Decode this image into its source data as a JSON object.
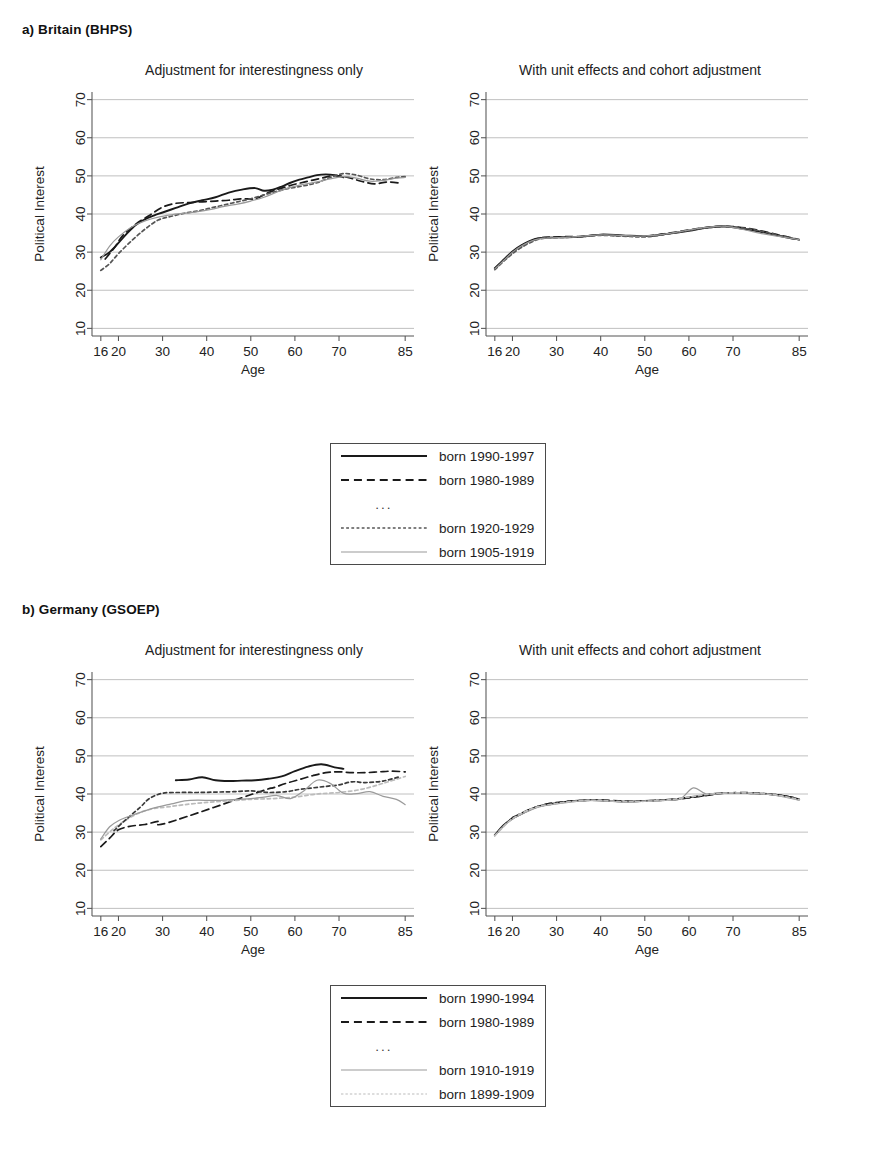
{
  "figure": {
    "sections": [
      {
        "id": "britain",
        "heading": "a) Britain (BHPS)"
      },
      {
        "id": "germany",
        "heading": "b) Germany (GSOEP)"
      }
    ],
    "panel_titles": {
      "left": "Adjustment for interestingness only",
      "right": "With unit effects and cohort adjustment"
    },
    "axis": {
      "xlabel": "Age",
      "ylabel": "Political Interest",
      "xticks": [
        16,
        20,
        30,
        40,
        50,
        60,
        70,
        85
      ],
      "xticklabels": [
        "16",
        "20",
        "30",
        "40",
        "50",
        "60",
        "70",
        "85"
      ],
      "yticks": [
        10,
        20,
        30,
        40,
        50,
        60,
        70
      ],
      "yticklabels": [
        "10",
        "20",
        "30",
        "40",
        "50",
        "60",
        "70"
      ],
      "xlim": [
        14,
        87
      ],
      "ylim": [
        8,
        72
      ]
    },
    "legends": {
      "britain": {
        "entries": [
          {
            "label": "born 1990-1997",
            "style": "solid",
            "color": "#1a1a1a",
            "width": 1.9
          },
          {
            "label": "born 1980-1989",
            "style": "dashed",
            "color": "#1a1a1a",
            "width": 1.9
          },
          {
            "label": "...",
            "style": "ellipsis",
            "color": "#3a3a3a",
            "width": 1
          },
          {
            "label": "born 1920-1929",
            "style": "dotted",
            "color": "#555555",
            "width": 1.4
          },
          {
            "label": "born 1905-1919",
            "style": "solid",
            "color": "#9a9a9a",
            "width": 1.2
          }
        ]
      },
      "germany": {
        "entries": [
          {
            "label": "born 1990-1994",
            "style": "solid",
            "color": "#1a1a1a",
            "width": 1.9
          },
          {
            "label": "born 1980-1989",
            "style": "dashed",
            "color": "#1a1a1a",
            "width": 1.9
          },
          {
            "label": "...",
            "style": "ellipsis",
            "color": "#3a3a3a",
            "width": 1
          },
          {
            "label": "born 1910-1919",
            "style": "solid",
            "color": "#9a9a9a",
            "width": 1.2
          },
          {
            "label": "born 1899-1909",
            "style": "dotted",
            "color": "#bbbbbb",
            "width": 1.2
          }
        ]
      }
    }
  },
  "chart_data": [
    {
      "id": "britain-left",
      "type": "line",
      "title": "Adjustment for interestingness only",
      "section": "a) Britain (BHPS)",
      "xlabel": "Age",
      "ylabel": "Political Interest",
      "xlim": [
        14,
        87
      ],
      "ylim": [
        8,
        72
      ],
      "grid": true,
      "legend_position": "below-figure",
      "series": [
        {
          "name": "born 1990-1997",
          "style": "solid",
          "color": "#1a1a1a",
          "x": [
            16,
            18,
            20,
            22,
            24,
            26,
            28,
            30,
            33,
            36,
            39,
            42,
            45,
            48,
            51,
            53,
            55,
            57,
            59,
            61,
            63,
            65,
            67,
            69,
            71
          ],
          "y": [
            28.6,
            30.0,
            32.4,
            35.0,
            37.2,
            38.6,
            39.6,
            40.4,
            41.6,
            42.8,
            43.6,
            44.4,
            45.6,
            46.4,
            46.8,
            46.1,
            46.4,
            47.2,
            48.2,
            49.0,
            49.6,
            50.2,
            50.4,
            50.2,
            49.6
          ]
        },
        {
          "name": "born 1980-1989",
          "style": "dashed",
          "color": "#1a1a1a",
          "x": [
            17,
            19,
            21,
            24,
            27,
            30,
            33,
            36,
            39,
            42,
            45,
            48,
            51,
            54,
            57,
            60,
            63,
            66,
            69,
            72,
            75,
            78,
            81,
            84
          ],
          "y": [
            28.2,
            31.0,
            34.4,
            37.4,
            39.6,
            41.8,
            42.8,
            43.0,
            43.2,
            43.4,
            43.6,
            44.0,
            44.0,
            45.6,
            46.8,
            47.8,
            48.6,
            49.4,
            50.1,
            49.6,
            48.6,
            47.9,
            48.4,
            48.1
          ]
        },
        {
          "name": "born 1920-1929",
          "style": "dotted",
          "color": "#555555",
          "x": [
            16,
            18,
            20,
            23,
            26,
            29,
            32,
            35,
            38,
            41,
            44,
            47,
            50,
            53,
            56,
            59,
            62,
            65,
            68,
            71,
            74,
            77,
            80,
            83,
            85
          ],
          "y": [
            25.2,
            27.0,
            29.6,
            33.0,
            36.0,
            38.4,
            39.4,
            40.2,
            40.8,
            41.6,
            42.4,
            43.2,
            44.0,
            45.0,
            46.0,
            46.8,
            47.4,
            48.2,
            49.6,
            50.6,
            50.2,
            49.2,
            49.0,
            49.6,
            49.8
          ]
        },
        {
          "name": "born 1905-1919",
          "style": "solid",
          "color": "#9a9a9a",
          "x": [
            16,
            18,
            20,
            23,
            26,
            29,
            32,
            35,
            38,
            41,
            44,
            47,
            50,
            53,
            56,
            59,
            62,
            65,
            68,
            71,
            74,
            77,
            80,
            83,
            85
          ],
          "y": [
            28.0,
            31.6,
            34.0,
            36.6,
            38.2,
            39.2,
            39.8,
            40.2,
            40.6,
            41.2,
            42.0,
            42.6,
            43.4,
            44.4,
            45.8,
            47.0,
            47.8,
            48.4,
            49.2,
            49.8,
            49.4,
            48.6,
            48.8,
            49.4,
            49.6
          ]
        }
      ]
    },
    {
      "id": "britain-right",
      "type": "line",
      "title": "With unit effects and cohort adjustment",
      "section": "a) Britain (BHPS)",
      "xlabel": "Age",
      "ylabel": "Political Interest",
      "xlim": [
        14,
        87
      ],
      "ylim": [
        8,
        72
      ],
      "grid": true,
      "legend_position": "below-figure",
      "series": [
        {
          "name": "born 1990-1997",
          "style": "solid",
          "color": "#1a1a1a",
          "x": [
            16,
            18,
            20,
            22,
            25,
            28,
            31,
            35,
            40,
            45,
            50,
            55,
            60,
            64,
            68,
            72,
            76,
            80,
            84
          ],
          "y": [
            25.8,
            28.0,
            30.2,
            31.8,
            33.4,
            33.8,
            33.9,
            34.0,
            34.6,
            34.4,
            34.2,
            34.8,
            35.6,
            36.4,
            36.8,
            36.2,
            35.4,
            34.4,
            33.4
          ]
        },
        {
          "name": "born 1980-1989",
          "style": "dashed",
          "color": "#1a1a1a",
          "x": [
            16,
            19,
            22,
            26,
            30,
            35,
            40,
            45,
            50,
            55,
            60,
            65,
            70,
            75,
            80,
            85
          ],
          "y": [
            25.6,
            29.0,
            31.6,
            33.6,
            34.0,
            34.1,
            34.5,
            34.3,
            34.2,
            34.9,
            35.8,
            36.6,
            36.7,
            35.9,
            34.6,
            33.3
          ]
        },
        {
          "name": "born 1920-1929",
          "style": "dotted",
          "color": "#555555",
          "x": [
            16,
            19,
            22,
            26,
            30,
            35,
            40,
            45,
            50,
            55,
            60,
            65,
            70,
            75,
            80,
            85
          ],
          "y": [
            25.4,
            28.6,
            31.2,
            33.4,
            33.8,
            34.0,
            34.4,
            34.2,
            34.0,
            34.7,
            35.7,
            36.5,
            36.6,
            35.8,
            34.5,
            33.2
          ]
        },
        {
          "name": "born 1905-1919",
          "style": "solid",
          "color": "#9a9a9a",
          "x": [
            16,
            18,
            20,
            22,
            25,
            28,
            32,
            36,
            40,
            44,
            48,
            52,
            56,
            60,
            64,
            68,
            72,
            76,
            80,
            85
          ],
          "y": [
            25.6,
            27.8,
            30.0,
            31.6,
            33.2,
            33.7,
            33.9,
            34.2,
            34.5,
            34.4,
            34.2,
            34.4,
            35.0,
            35.8,
            36.5,
            36.8,
            36.0,
            35.0,
            34.2,
            33.3
          ]
        }
      ]
    },
    {
      "id": "germany-left",
      "type": "line",
      "title": "Adjustment for interestingness only",
      "section": "b) Germany (GSOEP)",
      "xlabel": "Age",
      "ylabel": "Political Interest",
      "xlim": [
        14,
        87
      ],
      "ylim": [
        8,
        72
      ],
      "grid": true,
      "legend_position": "below-figure",
      "series": [
        {
          "name": "born 1990-1994",
          "style": "solid",
          "color": "#1a1a1a",
          "x": [
            33,
            36,
            39,
            42,
            45,
            48,
            51,
            54,
            57,
            60,
            63,
            66,
            69,
            71
          ],
          "y": [
            43.6,
            43.8,
            44.4,
            43.6,
            43.4,
            43.5,
            43.6,
            44.0,
            44.6,
            46.0,
            47.2,
            47.8,
            47.0,
            46.6
          ]
        },
        {
          "name": "born 1980-1989",
          "style": "dashed",
          "color": "#1a1a1a",
          "x": [
            16,
            18,
            20,
            23,
            26,
            29,
            31,
            52,
            55,
            58,
            61,
            64,
            67,
            70,
            73,
            76,
            79,
            82,
            85
          ],
          "y": [
            26.2,
            28.4,
            30.6,
            31.6,
            32.0,
            32.8,
            32.4,
            40.6,
            41.6,
            42.8,
            43.8,
            44.8,
            45.6,
            45.8,
            45.6,
            45.6,
            45.8,
            46.0,
            45.8
          ]
        },
        {
          "name": "born 1899-1909",
          "style": "dotted",
          "color": "#bbbbbb",
          "x": [
            16,
            19,
            22,
            25,
            28,
            31,
            35,
            40,
            45,
            50,
            55,
            60,
            65,
            70,
            75,
            80,
            85
          ],
          "y": [
            28.0,
            31.0,
            33.4,
            35.2,
            36.2,
            36.6,
            37.2,
            37.8,
            38.2,
            38.6,
            38.8,
            39.2,
            40.0,
            40.4,
            41.2,
            42.8,
            44.6
          ]
        },
        {
          "name": "born 1910-1919-dotted-dark",
          "style": "dotted",
          "color": "#3a3a3a",
          "x": [
            19,
            22,
            25,
            27,
            30,
            34,
            38,
            42,
            46,
            50,
            54,
            58,
            61,
            64,
            67,
            70,
            73,
            76,
            80,
            84
          ],
          "y": [
            30.4,
            33.6,
            36.6,
            38.8,
            40.2,
            40.4,
            40.4,
            40.5,
            40.6,
            40.8,
            40.4,
            40.6,
            41.2,
            41.6,
            42.0,
            42.4,
            43.2,
            43.0,
            43.4,
            44.6
          ]
        },
        {
          "name": "born 1910-1919",
          "style": "solid",
          "color": "#9a9a9a",
          "x": [
            16,
            18,
            20,
            23,
            26,
            29,
            32,
            35,
            38,
            41,
            44,
            47,
            50,
            53,
            56,
            59,
            62,
            65,
            68,
            71,
            74,
            77,
            80,
            83,
            85
          ],
          "y": [
            28.2,
            31.4,
            33.0,
            34.4,
            35.6,
            36.6,
            37.4,
            38.2,
            38.4,
            38.3,
            38.4,
            38.6,
            38.8,
            39.2,
            39.6,
            38.8,
            40.8,
            43.6,
            42.8,
            40.2,
            40.1,
            40.6,
            39.4,
            38.6,
            37.2
          ]
        }
      ]
    },
    {
      "id": "germany-right",
      "type": "line",
      "title": "With unit effects and cohort adjustment",
      "section": "b) Germany (GSOEP)",
      "xlabel": "Age",
      "ylabel": "Political Interest",
      "xlim": [
        14,
        87
      ],
      "ylim": [
        8,
        72
      ],
      "grid": true,
      "legend_position": "below-figure",
      "series": [
        {
          "name": "born 1990-1994",
          "style": "solid",
          "color": "#1a1a1a",
          "x": [
            16,
            18,
            20,
            23,
            26,
            30,
            34,
            38,
            42,
            46,
            50,
            54,
            58,
            62,
            66,
            70,
            74,
            78,
            82,
            85
          ],
          "y": [
            29.2,
            31.8,
            33.6,
            35.4,
            36.8,
            37.6,
            38.2,
            38.4,
            38.2,
            38.0,
            38.2,
            38.4,
            38.8,
            39.4,
            40.1,
            40.3,
            40.2,
            40.0,
            39.4,
            38.6
          ]
        },
        {
          "name": "born 1980-1989",
          "style": "dashed",
          "color": "#1a1a1a",
          "x": [
            20,
            24,
            28,
            32,
            36,
            40,
            44,
            48,
            52,
            56,
            60,
            64,
            68,
            72,
            76,
            80,
            84
          ],
          "y": [
            33.8,
            36.0,
            37.4,
            38.0,
            38.3,
            38.4,
            38.2,
            38.1,
            38.3,
            38.5,
            39.0,
            39.6,
            40.2,
            40.4,
            40.2,
            39.8,
            39.0
          ]
        },
        {
          "name": "born 1910-1919",
          "style": "solid",
          "color": "#9a9a9a",
          "x": [
            16,
            18,
            20,
            23,
            26,
            30,
            34,
            38,
            42,
            46,
            50,
            54,
            58,
            61,
            64,
            68,
            72,
            76,
            80,
            85
          ],
          "y": [
            29.0,
            31.6,
            33.4,
            35.2,
            36.6,
            37.4,
            38.0,
            38.3,
            38.1,
            37.9,
            38.1,
            38.3,
            38.7,
            41.6,
            40.0,
            40.2,
            40.3,
            40.1,
            39.6,
            38.4
          ]
        },
        {
          "name": "born 1899-1909",
          "style": "dotted",
          "color": "#bbbbbb",
          "x": [
            16,
            20,
            25,
            30,
            35,
            40,
            45,
            50,
            55,
            60,
            65,
            70,
            75,
            80,
            85
          ],
          "y": [
            29.1,
            33.5,
            36.4,
            37.5,
            38.2,
            38.3,
            38.0,
            38.1,
            38.4,
            39.2,
            40.0,
            40.3,
            40.2,
            39.7,
            38.5
          ]
        }
      ]
    }
  ]
}
